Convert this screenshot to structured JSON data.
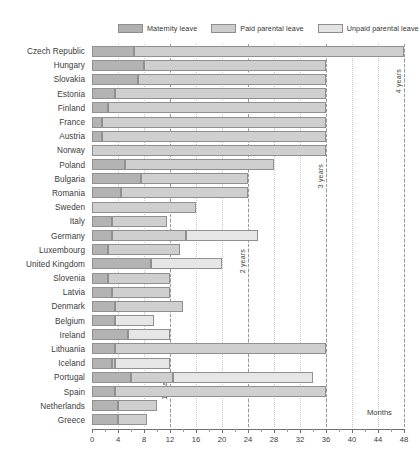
{
  "legend": {
    "items": [
      {
        "label": "Maternity leave",
        "color": "#b3b3b3",
        "key": "maternity"
      },
      {
        "label": "Paid parental leave",
        "color": "#cfcfcf",
        "key": "paid"
      },
      {
        "label": "Unpaid parental leave",
        "color": "#e6e6e6",
        "key": "unpaid"
      }
    ]
  },
  "axis": {
    "title": "Months",
    "ticks": [
      0,
      4,
      8,
      12,
      16,
      20,
      24,
      28,
      32,
      36,
      40,
      44,
      48
    ],
    "min": 0,
    "max": 48,
    "minor_step": 2
  },
  "annotations": [
    {
      "label": "1 year",
      "value": 12
    },
    {
      "label": "2 years",
      "value": 24
    },
    {
      "label": "3 years",
      "value": 36
    },
    {
      "label": "4 years",
      "value": 48
    }
  ],
  "chart_data": {
    "type": "bar",
    "orientation": "horizontal",
    "stacked": true,
    "title": "",
    "xlabel": "Months",
    "ylabel": "",
    "xlim": [
      0,
      48
    ],
    "grid": true,
    "legend_position": "top",
    "categories": [
      "Czech Republic",
      "Hungary",
      "Slovakia",
      "Estonia",
      "Finland",
      "France",
      "Austria",
      "Norway",
      "Poland",
      "Bulgaria",
      "Romania",
      "Sweden",
      "Italy",
      "Germany",
      "Luxembourg",
      "United Kingdom",
      "Slovenia",
      "Latvia",
      "Denmark",
      "Belgium",
      "Ireland",
      "Lithuania",
      "Iceland",
      "Portugal",
      "Spain",
      "Netherlands",
      "Greece"
    ],
    "series": [
      {
        "name": "Maternity leave",
        "color": "#b3b3b3",
        "values": [
          6.5,
          8,
          7,
          3.5,
          2.5,
          1.5,
          1.5,
          0,
          5,
          7.5,
          4.5,
          0,
          3,
          3,
          2.5,
          9,
          2.5,
          3,
          3.5,
          3.5,
          5.5,
          3.5,
          3,
          6,
          3.5,
          4,
          4
        ]
      },
      {
        "name": "Paid parental leave",
        "color": "#cfcfcf",
        "values": [
          41.5,
          28,
          29,
          32.5,
          33.5,
          34.5,
          34.5,
          36,
          23,
          16.5,
          19.5,
          16,
          8.5,
          11.5,
          11,
          0,
          9.5,
          9,
          10.5,
          0,
          0,
          32.5,
          0.5,
          6.5,
          32.5,
          6,
          4.5
        ]
      },
      {
        "name": "Unpaid parental leave",
        "color": "#e6e6e6",
        "values": [
          0,
          0,
          0,
          0,
          0,
          0,
          0,
          0,
          0,
          0,
          0,
          0,
          0,
          11,
          0,
          11,
          0,
          0,
          0,
          6,
          6.5,
          0,
          87,
          0,
          0,
          0,
          0
        ]
      }
    ],
    "bars": [
      {
        "category": "Czech Republic",
        "maternity": 6.5,
        "paid": 41.5,
        "unpaid": 0
      },
      {
        "category": "Hungary",
        "maternity": 8,
        "paid": 28,
        "unpaid": 0
      },
      {
        "category": "Slovakia",
        "maternity": 7,
        "paid": 29,
        "unpaid": 0
      },
      {
        "category": "Estonia",
        "maternity": 3.5,
        "paid": 32.5,
        "unpaid": 0
      },
      {
        "category": "Finland",
        "maternity": 2.5,
        "paid": 33.5,
        "unpaid": 0
      },
      {
        "category": "France",
        "maternity": 1.5,
        "paid": 34.5,
        "unpaid": 0
      },
      {
        "category": "Austria",
        "maternity": 1.5,
        "paid": 34.5,
        "unpaid": 0
      },
      {
        "category": "Norway",
        "maternity": 0,
        "paid": 36,
        "unpaid": 0
      },
      {
        "category": "Poland",
        "maternity": 5,
        "paid": 23,
        "unpaid": 0
      },
      {
        "category": "Bulgaria",
        "maternity": 7.5,
        "paid": 16.5,
        "unpaid": 0
      },
      {
        "category": "Romania",
        "maternity": 4.5,
        "paid": 19.5,
        "unpaid": 0
      },
      {
        "category": "Sweden",
        "maternity": 0,
        "paid": 16,
        "unpaid": 0
      },
      {
        "category": "Italy",
        "maternity": 3,
        "paid": 8.5,
        "unpaid": 0
      },
      {
        "category": "Germany",
        "maternity": 3,
        "paid": 11.5,
        "unpaid": 11
      },
      {
        "category": "Luxembourg",
        "maternity": 2.5,
        "paid": 11,
        "unpaid": 0
      },
      {
        "category": "United Kingdom",
        "maternity": 9,
        "paid": 0,
        "unpaid": 11
      },
      {
        "category": "Slovenia",
        "maternity": 2.5,
        "paid": 9.5,
        "unpaid": 0
      },
      {
        "category": "Latvia",
        "maternity": 3,
        "paid": 9,
        "unpaid": 0
      },
      {
        "category": "Denmark",
        "maternity": 3.5,
        "paid": 10.5,
        "unpaid": 0
      },
      {
        "category": "Belgium",
        "maternity": 3.5,
        "paid": 0,
        "unpaid": 6
      },
      {
        "category": "Ireland",
        "maternity": 5.5,
        "paid": 0,
        "unpaid": 6.5
      },
      {
        "category": "Lithuania",
        "maternity": 3.5,
        "paid": 32.5,
        "unpaid": 0
      },
      {
        "category": "Iceland",
        "maternity": 3,
        "paid": 0.5,
        "unpaid": 8.5
      },
      {
        "category": "Portugal",
        "maternity": 6,
        "paid": 6.5,
        "unpaid": 21.5
      },
      {
        "category": "Spain",
        "maternity": 3.5,
        "paid": 32.5,
        "unpaid": 0
      },
      {
        "category": "Netherlands",
        "maternity": 4,
        "paid": 6,
        "unpaid": 0
      },
      {
        "category": "Greece",
        "maternity": 4,
        "paid": 4.5,
        "unpaid": 0
      }
    ]
  }
}
